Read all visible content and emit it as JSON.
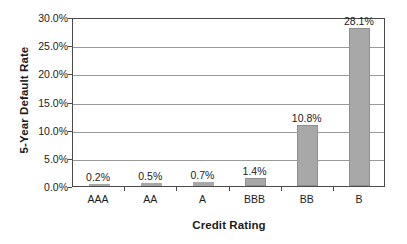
{
  "chart_data": {
    "type": "bar",
    "title": "",
    "xlabel": "Credit Rating",
    "ylabel": "5-Year Default Rate",
    "categories": [
      "AAA",
      "AA",
      "A",
      "BBB",
      "BB",
      "B"
    ],
    "values": [
      0.2,
      0.5,
      0.7,
      1.4,
      10.8,
      28.1
    ],
    "data_labels": [
      "0.2%",
      "0.5%",
      "0.7%",
      "1.4%",
      "10.8%",
      "28.1%"
    ],
    "ylim": [
      0.0,
      30.0
    ],
    "ytick_values": [
      0.0,
      5.0,
      10.0,
      15.0,
      20.0,
      25.0,
      30.0
    ],
    "ytick_labels": [
      "0.0%",
      "5.0%",
      "10.0%",
      "15.0%",
      "20.0%",
      "25.0%",
      "30.0%"
    ],
    "grid": true,
    "legend": false,
    "legend_position": "none",
    "series": [
      {
        "name": "5-Year Default Rate",
        "values": [
          0.2,
          0.5,
          0.7,
          1.4,
          10.8,
          28.1
        ]
      }
    ],
    "colors": {
      "bar_fill": "#a8a8a8",
      "bar_edge": "#8f8f8f",
      "gridline": "#9a9a9a",
      "frame": "#4a4a4a",
      "text": "#1c1c1c",
      "background": "#ffffff"
    }
  }
}
